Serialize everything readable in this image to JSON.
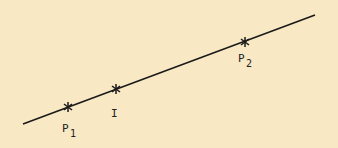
{
  "diagram": {
    "background": "#f8e8c4",
    "line_color": "#1a1a1a",
    "line": {
      "x1": 23,
      "y1": 124,
      "x2": 315,
      "y2": 15
    },
    "points": [
      {
        "name": "P",
        "subscript": "1",
        "x": 68,
        "y": 107
      },
      {
        "name": "I",
        "subscript": "",
        "x": 116,
        "y": 89
      },
      {
        "name": "P",
        "subscript": "2",
        "x": 245,
        "y": 42
      }
    ],
    "labels": {
      "p1_main": "P",
      "p1_sub": "1",
      "i_main": "I",
      "p2_main": "P",
      "p2_sub": "2"
    }
  }
}
